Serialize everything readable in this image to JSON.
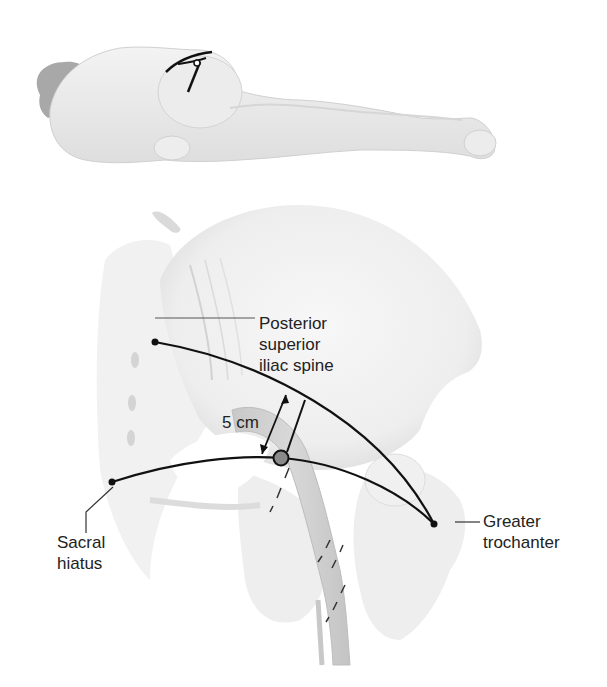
{
  "diagram": {
    "type": "anatomical-illustration",
    "colors": {
      "background": "#ffffff",
      "bone_fill": "#efefef",
      "bone_shadow": "#d9d9d9",
      "nerve_fill": "#cfcfcf",
      "line": "#111111",
      "text": "#222222",
      "marker_fill": "#8a8a8a"
    },
    "labels": {
      "psis": [
        "Posterior",
        "superior",
        "iliac spine"
      ],
      "sacral_hiatus": [
        "Sacral",
        "hiatus"
      ],
      "greater_trochanter": [
        "Greater",
        "trochanter"
      ],
      "distance": "5 cm"
    },
    "landmarks": [
      {
        "name": "Posterior superior iliac spine",
        "x": 155,
        "y": 342
      },
      {
        "name": "Sacral hiatus",
        "x": 112,
        "y": 482
      },
      {
        "name": "Greater trochanter",
        "x": 434,
        "y": 524
      },
      {
        "name": "Needle insertion point",
        "x": 281,
        "y": 458
      }
    ],
    "measurement": {
      "label": "5 cm",
      "orientation": "perpendicular to PSIS–trochanter line"
    }
  }
}
